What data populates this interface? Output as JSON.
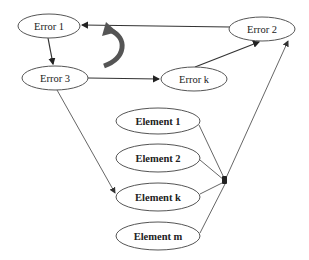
{
  "diagram": {
    "type": "error-propagation graph",
    "error_nodes": [
      {
        "id": "error1",
        "label": "Error 1"
      },
      {
        "id": "error2",
        "label": "Error 2"
      },
      {
        "id": "error3",
        "label": "Error 3"
      },
      {
        "id": "errork",
        "label": "Error k"
      }
    ],
    "element_nodes": [
      {
        "id": "element1",
        "label": "Element 1"
      },
      {
        "id": "element2",
        "label": "Element 2"
      },
      {
        "id": "elementk",
        "label": "Element k"
      },
      {
        "id": "elementm",
        "label": "Element m"
      }
    ],
    "edges": [
      {
        "from": "error2",
        "to": "error1",
        "style": "thick"
      },
      {
        "from": "error1",
        "to": "error3",
        "style": "thick"
      },
      {
        "from": "error3",
        "to": "errork",
        "style": "thick"
      },
      {
        "from": "errork",
        "to": "error2",
        "style": "thick"
      },
      {
        "from": "error3",
        "to": "elementk",
        "style": "thin"
      },
      {
        "from": "element1",
        "to": "junction",
        "style": "thin"
      },
      {
        "from": "element2",
        "to": "junction",
        "style": "thin"
      },
      {
        "from": "elementk",
        "to": "junction",
        "style": "thin"
      },
      {
        "from": "elementm",
        "to": "junction",
        "style": "thin"
      },
      {
        "from": "junction",
        "to": "error2",
        "style": "thin"
      }
    ],
    "cycle_indicator": "curved-arrow-counterclockwise",
    "colors": {
      "stroke": "#333333",
      "ellipse_stroke": "#555555",
      "cycle_arrow": "#555555",
      "background": "#ffffff"
    }
  }
}
